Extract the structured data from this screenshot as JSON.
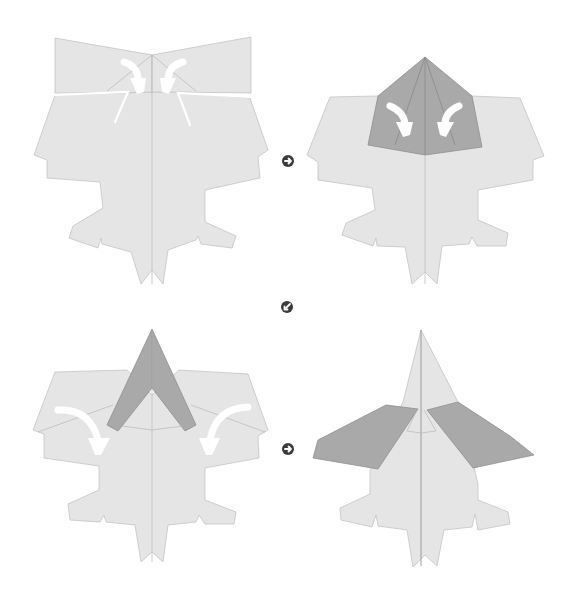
{
  "diagram": {
    "title": "",
    "type": "origami-folding-instructions",
    "colors": {
      "background": "#ffffff",
      "paper": "#e5e5e5",
      "paper_edge": "#c4c4c4",
      "folded_layer": "#a9a9a9",
      "crease": "#b8b8b8",
      "arrow": "#ffffff",
      "step_icon": "#3a3a3a"
    },
    "panels": [
      {
        "id": "panel-1",
        "position": "top-left",
        "action": "fold top flaps inward",
        "arrows": [
          "fold-arrow-left",
          "fold-arrow-right"
        ]
      },
      {
        "id": "panel-2",
        "position": "top-right",
        "action": "fold dark pentagon edges to center",
        "arrows": [
          "fold-arrow-left",
          "fold-arrow-right"
        ]
      },
      {
        "id": "panel-3",
        "position": "bottom-left",
        "action": "fold wings down",
        "arrows": [
          "fold-arrow-left",
          "fold-arrow-right"
        ]
      },
      {
        "id": "panel-4",
        "position": "bottom-right",
        "action": "result with swept wings",
        "arrows": []
      }
    ],
    "step_icons": [
      {
        "id": "next-icon-1",
        "direction": "right",
        "between": "panel-1 → panel-2"
      },
      {
        "id": "next-icon-2",
        "direction": "down-left",
        "between": "panel-2 → panel-3"
      },
      {
        "id": "next-icon-3",
        "direction": "right",
        "between": "panel-3 → panel-4"
      }
    ]
  }
}
